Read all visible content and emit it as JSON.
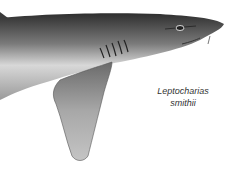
{
  "illustration": {
    "subject": "shark-illustration",
    "caption": {
      "line1": "Leptocharias",
      "line2": "smithii"
    },
    "colors": {
      "background": "#ffffff",
      "body_dark": "#3a3a3a",
      "body_light": "#e8e8e8",
      "fin": "#9a9a9a",
      "caption_text": "#333333"
    }
  }
}
